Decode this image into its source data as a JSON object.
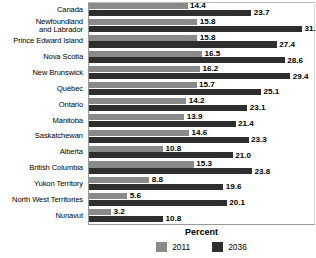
{
  "chart_data": {
    "type": "bar",
    "orientation": "horizontal",
    "title": "",
    "xlabel": "Percent",
    "ylabel": "",
    "grid": false,
    "legend_position": "bottom-center",
    "xlim": [
      0,
      33
    ],
    "categories": [
      "Canada",
      "Newfoundland\nand Labrador",
      "Prince Edward Island",
      "Nova Scotia",
      "New Brunswick",
      "Québec",
      "Ontario",
      "Manitoba",
      "Saskatchewan",
      "Alberta",
      "British Columbia",
      "Yukon Territory",
      "North West Territories",
      "Nunavut"
    ],
    "series": [
      {
        "name": "2011",
        "color": "#8a8a8a",
        "values": [
          14.4,
          15.8,
          15.8,
          16.5,
          16.2,
          15.7,
          14.2,
          13.9,
          14.6,
          10.8,
          15.3,
          8.8,
          5.6,
          3.2
        ],
        "labels": [
          "14.4",
          "15.8",
          "15.8",
          "16.5",
          "16.2",
          "15.7",
          "14.2",
          "13.9",
          "14.6",
          "10.8",
          "15.3",
          "8.8",
          "5.6",
          "3.2"
        ]
      },
      {
        "name": "2036",
        "color": "#2e2e2e",
        "values": [
          23.7,
          31.1,
          27.4,
          28.6,
          29.4,
          25.1,
          23.1,
          21.4,
          23.3,
          21.0,
          23.8,
          19.6,
          20.1,
          10.8
        ],
        "labels": [
          "23.7",
          "31.10",
          "27.4",
          "28.6",
          "29.4",
          "25.1",
          "23.1",
          "21.4",
          "23.3",
          "21.0",
          "23.8",
          "19.6",
          "20.1",
          "10.8"
        ]
      }
    ]
  },
  "legend": {
    "items": [
      {
        "label": "2011",
        "color": "#8a8a8a"
      },
      {
        "label": "2036",
        "color": "#2e2e2e"
      }
    ]
  },
  "axis": {
    "x_title": "Percent"
  }
}
